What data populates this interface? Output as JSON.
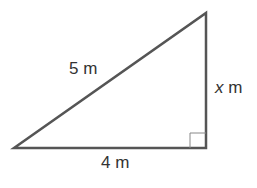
{
  "figure": {
    "type": "right-triangle",
    "stroke_color": "#555555",
    "vertices": {
      "left": [
        14,
        148
      ],
      "right_angle": [
        206,
        148
      ],
      "top": [
        206,
        13
      ]
    },
    "right_angle_box": {
      "x": 190,
      "y": 133,
      "size": 15
    },
    "labels": {
      "hypotenuse": "5 m",
      "vertical_var": "x",
      "vertical_unit": " m",
      "base": "4 m"
    }
  }
}
